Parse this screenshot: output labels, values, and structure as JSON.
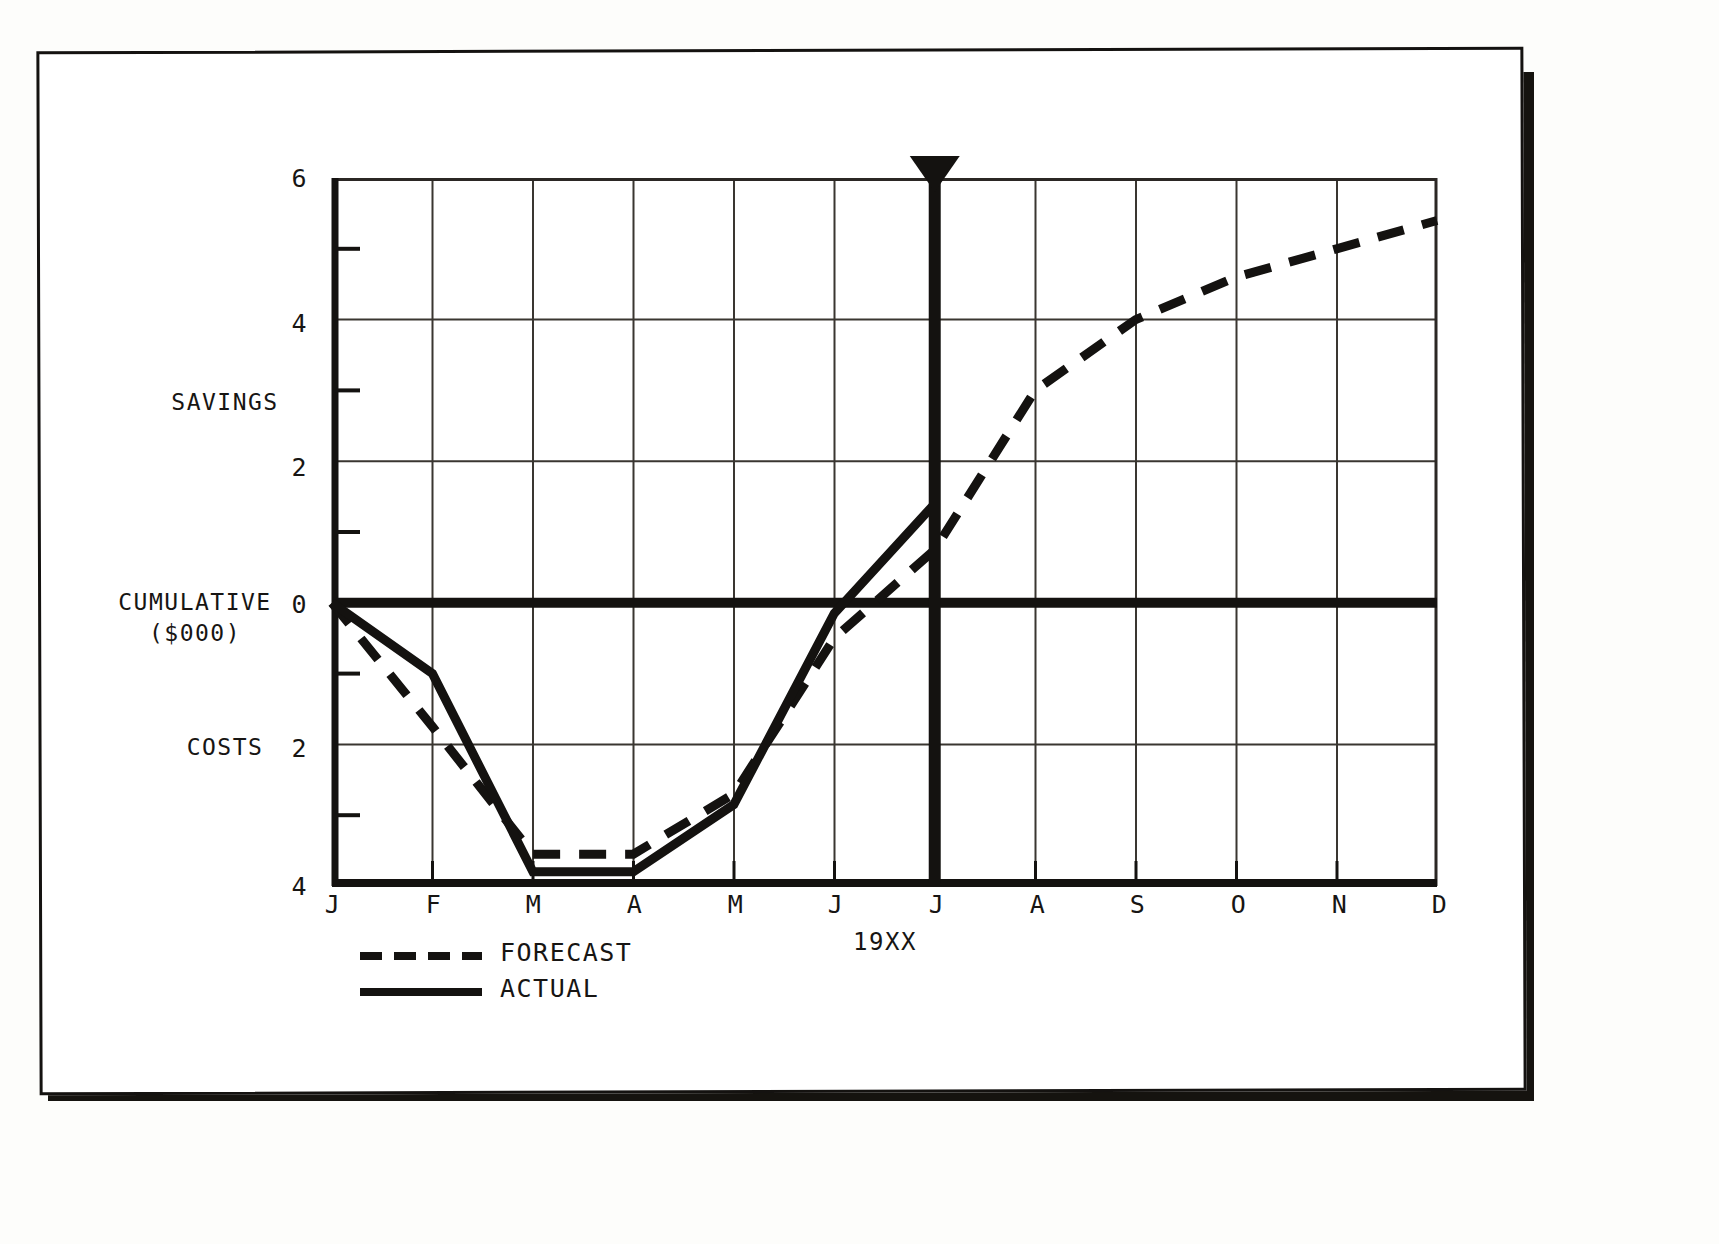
{
  "chart_data": {
    "type": "line",
    "title": "",
    "xlabel": "19XX",
    "ylabel_upper": "SAVINGS",
    "ylabel_zero": "CUMULATIVE\n($000)",
    "ylabel_lower": "COSTS",
    "grid": true,
    "legend_position": "below-left",
    "x": [
      "J",
      "F",
      "M",
      "A",
      "M",
      "J",
      "J",
      "A",
      "S",
      "O",
      "N",
      "D"
    ],
    "x_full_names": [
      "January",
      "February",
      "March",
      "April",
      "May",
      "June",
      "July",
      "August",
      "September",
      "October",
      "November",
      "December"
    ],
    "ylim": [
      -4,
      6
    ],
    "y_major_ticks": [
      6,
      4,
      2,
      0,
      -2,
      -4
    ],
    "y_tick_labels": [
      "6",
      "4",
      "2",
      "0",
      "2",
      "4"
    ],
    "y_minor_ticks": [
      5,
      3,
      1,
      -1,
      -3
    ],
    "units": "$000 cumulative",
    "series": [
      {
        "name": "FORECAST",
        "style": "dashed",
        "color": "#141210",
        "values": [
          0,
          -1.75,
          -3.55,
          -3.55,
          -2.7,
          -0.5,
          0.75,
          3.0,
          4.0,
          4.6,
          5.0,
          5.4
        ]
      },
      {
        "name": "ACTUAL",
        "style": "solid",
        "color": "#141210",
        "values": [
          0,
          -1.0,
          -3.8,
          -3.8,
          -2.85,
          -0.15,
          1.4,
          null,
          null,
          null,
          null,
          null
        ]
      }
    ],
    "annotations": [
      {
        "name": "today-marker",
        "type": "vertical-line-with-arrow",
        "at_x": "J",
        "at_x_index": 6,
        "label": ""
      },
      {
        "name": "zero-line",
        "type": "horizontal-emphasis",
        "at_y": 0
      }
    ]
  },
  "legend": {
    "items": [
      {
        "label": "FORECAST",
        "style": "dashed"
      },
      {
        "label": "ACTUAL",
        "style": "solid"
      }
    ]
  },
  "labels": {
    "savings": "SAVINGS",
    "cumulative_line1": "CUMULATIVE",
    "cumulative_line2": "($000)",
    "costs": "COSTS",
    "year": "19XX"
  }
}
